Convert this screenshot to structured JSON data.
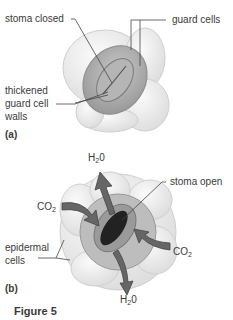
{
  "figure": {
    "caption": "Figure 5",
    "panel_a": {
      "tag": "(a)",
      "labels": {
        "stoma_closed": "stoma closed",
        "guard_cells": "guard cells",
        "thickened_line1": "thickened",
        "thickened_line2": "guard cell",
        "thickened_line3": "walls"
      }
    },
    "panel_b": {
      "tag": "(b)",
      "labels": {
        "h2o_top": "H",
        "h2o_top_sub": "2",
        "h2o_top_end": "0",
        "co2_left": "CO",
        "co2_left_sub": "2",
        "stoma_open": "stoma open",
        "epidermal_line1": "epidermal",
        "epidermal_line2": "cells",
        "co2_right": "CO",
        "co2_right_sub": "2",
        "h2o_bottom": "H",
        "h2o_bottom_sub": "2",
        "h2o_bottom_end": "0"
      }
    }
  }
}
